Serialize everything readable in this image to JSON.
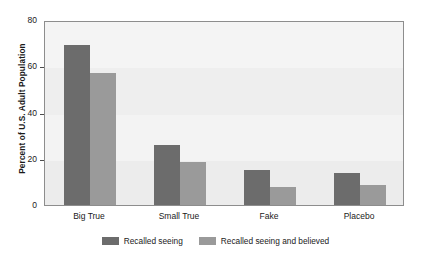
{
  "chart_data": {
    "type": "bar",
    "title": "",
    "xlabel": "",
    "ylabel": "Percent of U.S. Adult Population",
    "categories": [
      "Big True",
      "Small True",
      "Fake",
      "Placebo"
    ],
    "series": [
      {
        "name": "Recalled seeing",
        "color": "#6c6c6c",
        "values": [
          69,
          26,
          15,
          14
        ]
      },
      {
        "name": "Recalled seeing and believed",
        "color": "#9a9a9a",
        "values": [
          57,
          18.5,
          8,
          8.5
        ]
      }
    ],
    "ylim": [
      0,
      80
    ],
    "yticks": [
      0,
      20,
      40,
      60,
      80
    ],
    "ytick_labels": [
      "0",
      "20",
      "40",
      "60",
      "80"
    ],
    "grid": false,
    "legend_position": "bottom-center",
    "plot_background": "#f2f2f2",
    "frame_color": "#8d8d8d"
  }
}
